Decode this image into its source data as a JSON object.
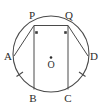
{
  "figure": {
    "background_color": "#ffffff",
    "stroke_color": "#4a4a4a",
    "label_color": "#2b2b2b"
  },
  "circle": {
    "center_x": 51,
    "center_y": 54,
    "radius": 38,
    "center_label": "O"
  },
  "points": [
    {
      "id": "A",
      "label": "A",
      "x": 14,
      "y": 56,
      "label_x": 8,
      "label_y": 60
    },
    {
      "id": "P",
      "label": "P",
      "x": 34,
      "y": 25,
      "label_x": 30,
      "label_y": 18
    },
    {
      "id": "Q",
      "label": "Q",
      "x": 68,
      "y": 25,
      "label_x": 64,
      "label_y": 18
    },
    {
      "id": "D",
      "label": "D",
      "x": 88,
      "y": 56,
      "label_x": 88,
      "label_y": 60
    },
    {
      "id": "B",
      "label": "B",
      "x": 34,
      "y": 90,
      "label_x": 30,
      "label_y": 102
    },
    {
      "id": "C",
      "label": "C",
      "x": 68,
      "y": 90,
      "label_x": 64,
      "label_y": 102
    }
  ],
  "segments": [
    {
      "id": "PQ",
      "from": "P",
      "to": "Q",
      "kind": "chord"
    },
    {
      "id": "PB",
      "from": "P",
      "to": "B",
      "kind": "chord"
    },
    {
      "id": "QC",
      "from": "Q",
      "to": "C",
      "kind": "chord"
    },
    {
      "id": "AP",
      "from": "A",
      "to": "P",
      "kind": "chord"
    },
    {
      "id": "DQ",
      "from": "D",
      "to": "Q",
      "kind": "chord"
    }
  ],
  "right_angle_marks": [
    {
      "id": "angle-at-P",
      "at": "P"
    },
    {
      "id": "angle-at-Q",
      "at": "Q"
    }
  ],
  "arc_tick_marks": [
    {
      "id": "tick-arc-AB",
      "arc": "AB"
    },
    {
      "id": "tick-arc-DC",
      "arc": "DC"
    }
  ],
  "center_dot": {
    "visible": true
  }
}
